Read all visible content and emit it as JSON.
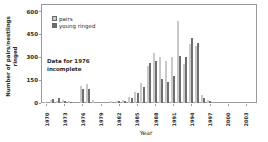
{
  "chart_data": {
    "type": "bar",
    "title": "",
    "xlabel": "Year",
    "ylabel": "Number of pairs/nestlings ringed",
    "ylabel_line1": "Number of pairs/nestlings",
    "ylabel_line2": "ringed",
    "annotation": {
      "line1": "Data for 1976",
      "line2": "incomplete"
    },
    "legend": {
      "position": "top-left-inside",
      "entries": [
        "pairs",
        "young ringed"
      ]
    },
    "categories": [
      1970,
      1971,
      1972,
      1973,
      1974,
      1975,
      1976,
      1977,
      1978,
      1979,
      1980,
      1981,
      1982,
      1983,
      1984,
      1985,
      1986,
      1987,
      1988,
      1989,
      1990,
      1991,
      1992,
      1993,
      1994,
      1995,
      1996,
      1997,
      1998,
      1999,
      2000,
      2001,
      2002,
      2003
    ],
    "x_tick_years": [
      1970,
      1973,
      1976,
      1979,
      1982,
      1985,
      1988,
      1991,
      1994,
      1997,
      2000,
      2003
    ],
    "series": [
      {
        "name": "pairs",
        "color": "#c9c9c9",
        "values": [
          8,
          18,
          13,
          20,
          13,
          0,
          110,
          125,
          20,
          0,
          0,
          12,
          15,
          22,
          40,
          75,
          130,
          245,
          330,
          300,
          275,
          300,
          540,
          255,
          385,
          375,
          55,
          22,
          0,
          0,
          0,
          0,
          0,
          0
        ]
      },
      {
        "name": "young ringed",
        "color": "#6f6f6f",
        "values": [
          0,
          26,
          33,
          10,
          7,
          0,
          90,
          95,
          0,
          0,
          0,
          0,
          10,
          15,
          32,
          65,
          105,
          265,
          275,
          155,
          135,
          180,
          310,
          300,
          430,
          395,
          35,
          13,
          0,
          0,
          0,
          0,
          0,
          0
        ]
      }
    ],
    "yticks": [
      0,
      150,
      300,
      450,
      600
    ],
    "ylim": [
      0,
      650
    ],
    "grid": false
  },
  "colors": {
    "axis": "#9a9a9a",
    "text": "#2b2b2b",
    "background": "#ffffff",
    "pairs_bar": "#c9c9c9",
    "young_bar": "#6f6f6f"
  }
}
